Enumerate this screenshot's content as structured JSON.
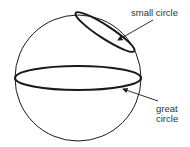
{
  "diagram": {
    "labels": {
      "small_circle": "small circle",
      "great_circle_line1": "great",
      "great_circle_line2": "circle"
    },
    "colors": {
      "stroke": "#1a1a1a",
      "text": "#333333",
      "background": "#ffffff"
    }
  }
}
